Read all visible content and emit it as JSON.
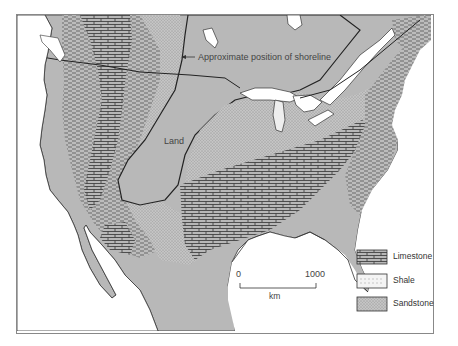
{
  "map": {
    "annotations": {
      "shoreline": "Approximate position of shoreline",
      "land": "Land"
    },
    "scale_bar": {
      "start": "0",
      "end": "1000",
      "unit": "km"
    },
    "legend": {
      "items": [
        {
          "label": "Limestone",
          "pattern": "brick"
        },
        {
          "label": "Shale",
          "pattern": "dashes"
        },
        {
          "label": "Sandstone",
          "pattern": "dots"
        }
      ]
    },
    "colors": {
      "land_gray": "#b8b8b8",
      "water_white": "#ffffff",
      "outline": "#222222"
    }
  }
}
